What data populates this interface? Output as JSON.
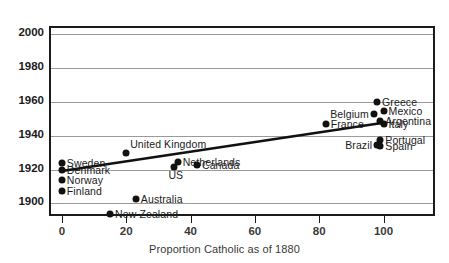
{
  "figure": {
    "background_color": "#ffffff",
    "frame_color": "#1b1b1b",
    "grid_color": "#9a9a9a",
    "point_color": "#111111",
    "trendline_color": "#111111",
    "top_partial_text": "· · ·   · ·   · · · ·   · · ·   · ·   · · ·   · ·"
  },
  "chart_data": {
    "type": "scatter",
    "title": "",
    "xlabel": "Proportion Catholic as of 1880",
    "ylabel": "",
    "xlim": [
      -4,
      116
    ],
    "ylim": [
      1892,
      2004
    ],
    "xticks": [
      0,
      20,
      40,
      60,
      80,
      100
    ],
    "xtick_labels": [
      "0",
      "20",
      "40",
      "60",
      "80",
      "100"
    ],
    "yticks": [
      1900,
      1920,
      1940,
      1960,
      1980,
      2000
    ],
    "ytick_labels": [
      "1900",
      "1920",
      "1940",
      "1960",
      "1980",
      "2000"
    ],
    "grid": "horizontal",
    "legend": "none",
    "trendline": {
      "x": [
        0,
        100
      ],
      "y": [
        1918.5,
        1947.0
      ]
    },
    "points": [
      {
        "label": "Sweden",
        "x": 0,
        "y": 1923,
        "label_pos": "right"
      },
      {
        "label": "Denmark",
        "x": 0,
        "y": 1919,
        "label_pos": "right"
      },
      {
        "label": "Norway",
        "x": 0,
        "y": 1913,
        "label_pos": "right"
      },
      {
        "label": "Finland",
        "x": 0,
        "y": 1907,
        "label_pos": "right"
      },
      {
        "label": "New Zealand",
        "x": 15,
        "y": 1893,
        "label_pos": "right"
      },
      {
        "label": "United Kingdom",
        "x": 20,
        "y": 1929,
        "label_pos": "top"
      },
      {
        "label": "Australia",
        "x": 23,
        "y": 1902,
        "label_pos": "right"
      },
      {
        "label": "US",
        "x": 35,
        "y": 1921,
        "label_pos": "below"
      },
      {
        "label": "Netherlands",
        "x": 36,
        "y": 1924,
        "label_pos": "right"
      },
      {
        "label": "Canada",
        "x": 42,
        "y": 1922,
        "label_pos": "right"
      },
      {
        "label": "France",
        "x": 82,
        "y": 1946,
        "label_pos": "right"
      },
      {
        "label": "Belgium",
        "x": 97,
        "y": 1952,
        "label_pos": "left"
      },
      {
        "label": "Greece",
        "x": 98,
        "y": 1959,
        "label_pos": "right"
      },
      {
        "label": "Mexico",
        "x": 100,
        "y": 1954,
        "label_pos": "right"
      },
      {
        "label": "Argentina",
        "x": 99,
        "y": 1948,
        "label_pos": "right"
      },
      {
        "label": "Italy",
        "x": 100,
        "y": 1946,
        "label_pos": "right"
      },
      {
        "label": "Portugal",
        "x": 99,
        "y": 1937,
        "label_pos": "right"
      },
      {
        "label": "Brazil",
        "x": 98,
        "y": 1934,
        "label_pos": "left"
      },
      {
        "label": "Spain",
        "x": 99,
        "y": 1933,
        "label_pos": "right"
      }
    ]
  }
}
